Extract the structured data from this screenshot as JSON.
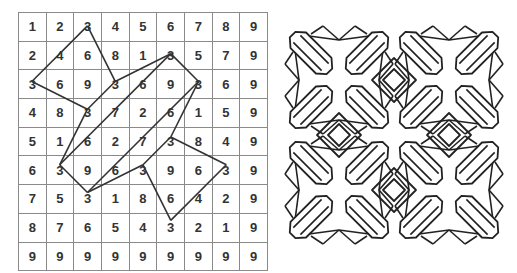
{
  "left_figure": {
    "type": "number-grid",
    "rows": [
      [
        "1",
        "2",
        "3",
        "4",
        "5",
        "6",
        "7",
        "8",
        "9"
      ],
      [
        "2",
        "4",
        "6",
        "8",
        "1",
        "3",
        "5",
        "7",
        "9"
      ],
      [
        "3",
        "6",
        "9",
        "3",
        "6",
        "9",
        "3",
        "6",
        "9"
      ],
      [
        "4",
        "8",
        "3",
        "7",
        "2",
        "6",
        "1",
        "5",
        "9"
      ],
      [
        "5",
        "1",
        "6",
        "2",
        "7",
        "3",
        "8",
        "4",
        "9"
      ],
      [
        "6",
        "3",
        "9",
        "6",
        "3",
        "9",
        "6",
        "3",
        "9"
      ],
      [
        "7",
        "5",
        "3",
        "1",
        "8",
        "6",
        "4",
        "2",
        "9"
      ],
      [
        "8",
        "7",
        "6",
        "5",
        "4",
        "3",
        "2",
        "1",
        "9"
      ],
      [
        "9",
        "9",
        "9",
        "9",
        "9",
        "9",
        "9",
        "9",
        "9"
      ]
    ],
    "line_color": "#333333",
    "segments": [
      [
        [
          0,
          2
        ],
        [
          2,
          0
        ]
      ],
      [
        [
          2,
          0
        ],
        [
          3,
          2
        ]
      ],
      [
        [
          0,
          2
        ],
        [
          2,
          3
        ]
      ],
      [
        [
          2,
          3
        ],
        [
          1,
          5
        ]
      ],
      [
        [
          2,
          3
        ],
        [
          3,
          2
        ]
      ],
      [
        [
          3,
          2
        ],
        [
          5,
          1
        ]
      ],
      [
        [
          1,
          5
        ],
        [
          5,
          1
        ]
      ],
      [
        [
          1,
          5
        ],
        [
          2,
          6
        ]
      ],
      [
        [
          2,
          6
        ],
        [
          6,
          2
        ]
      ],
      [
        [
          2,
          6
        ],
        [
          4,
          5
        ]
      ],
      [
        [
          5,
          1
        ],
        [
          6,
          2
        ]
      ],
      [
        [
          6,
          2
        ],
        [
          5,
          4
        ]
      ],
      [
        [
          5,
          4
        ],
        [
          4,
          5
        ]
      ],
      [
        [
          5,
          4
        ],
        [
          7,
          5
        ]
      ],
      [
        [
          7,
          5
        ],
        [
          5,
          7
        ]
      ],
      [
        [
          5,
          7
        ],
        [
          4,
          5
        ]
      ]
    ]
  },
  "right_figure": {
    "type": "geometric-tile-pattern",
    "motif_grid": [
      2,
      2
    ],
    "stroke_color": "#222222"
  }
}
